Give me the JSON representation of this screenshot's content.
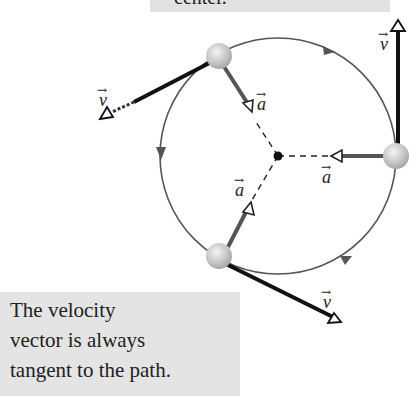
{
  "top_box": {
    "text": "center."
  },
  "caption": {
    "lines": [
      "The velocity",
      "vector is always",
      "tangent to the path."
    ]
  },
  "labels": {
    "v_top": "v",
    "v_left": "v",
    "v_bottom": "v",
    "a_top": "a",
    "a_right": "a",
    "a_bottom": "a",
    "arrow": "→"
  },
  "colors": {
    "circle": "#555555",
    "velocity": "#1a1a1a",
    "acceleration": "#555555",
    "ball": "#c8c8c8",
    "box_bg": "#e4e4e4"
  }
}
